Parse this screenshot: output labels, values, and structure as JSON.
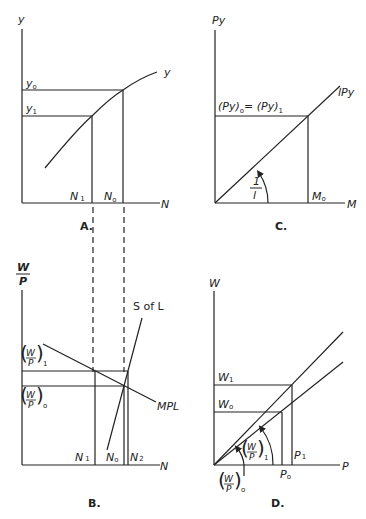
{
  "panels": {
    "A": {
      "caption": "A.",
      "y_axis_label": "y",
      "x_axis_label": "N",
      "curve_label": "y",
      "levels": {
        "y0": "y",
        "y0_sub": "o",
        "y1": "y",
        "y1_sub": "1"
      },
      "ticks": {
        "N1": "N",
        "N1_sub": "1",
        "N0": "N",
        "N0_sub": "o"
      }
    },
    "B": {
      "caption": "B.",
      "y_axis_num": "W",
      "y_axis_den": "P",
      "x_axis_label": "N",
      "supply_label": "S of L",
      "demand_label": "MPL",
      "levels": {
        "wp1_num": "W",
        "wp1_den": "P",
        "wp1_sub": "1",
        "wp0_num": "W",
        "wp0_den": "P",
        "wp0_sub": "o"
      },
      "ticks": {
        "N1": "N",
        "N1_sub": "1",
        "N0": "N",
        "N0_sub": "o",
        "N2": "N",
        "N2_sub": "2"
      }
    },
    "C": {
      "caption": "C.",
      "y_axis_label": "Py",
      "x_axis_label": "M",
      "line_label": "lPy",
      "level_label": "(Py)",
      "level_sub0": "o",
      "level_eq": "= (Py)",
      "level_sub1": "1",
      "slope_num": "1",
      "slope_den": "l",
      "tick_M0": "M",
      "tick_M0_sub": "o"
    },
    "D": {
      "caption": "D.",
      "y_axis_label": "W",
      "x_axis_label": "P",
      "levels": {
        "W1": "W",
        "W1_sub": "1",
        "W0": "W",
        "W0_sub": "o"
      },
      "ticks": {
        "P0": "P",
        "P0_sub": "o",
        "P1": "P",
        "P1_sub": "1"
      },
      "angle1": {
        "num": "W",
        "den": "P",
        "sub": "1"
      },
      "angle0": {
        "num": "W",
        "den": "P",
        "sub": "o"
      }
    }
  }
}
